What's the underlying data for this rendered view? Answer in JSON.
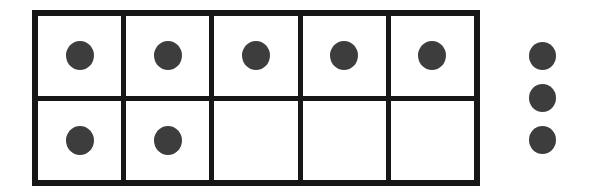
{
  "scene": {
    "title": "Ten frame with counters",
    "background_color": "#ffffff"
  },
  "ten_frame": {
    "name": "ten-frame",
    "columns": 5,
    "rows": 2,
    "total_cells": 10,
    "border_color": "#171717",
    "border_width_px": 6,
    "cell_background": "#ffffff",
    "grid": [
      [
        {
          "cell_index": 1,
          "filled": true,
          "counter_label": "counter"
        },
        {
          "cell_index": 2,
          "filled": true,
          "counter_label": "counter"
        },
        {
          "cell_index": 3,
          "filled": true,
          "counter_label": "counter"
        },
        {
          "cell_index": 4,
          "filled": true,
          "counter_label": "counter"
        },
        {
          "cell_index": 5,
          "filled": true,
          "counter_label": "counter"
        }
      ],
      [
        {
          "cell_index": 6,
          "filled": true,
          "counter_label": "counter"
        },
        {
          "cell_index": 7,
          "filled": true,
          "counter_label": "counter"
        },
        {
          "cell_index": 8,
          "filled": false,
          "counter_label": ""
        },
        {
          "cell_index": 9,
          "filled": false,
          "counter_label": ""
        },
        {
          "cell_index": 10,
          "filled": false,
          "counter_label": ""
        }
      ]
    ],
    "counters_in_frame": 7,
    "empty_cells": 3
  },
  "loose_counters": {
    "name": "loose-counters",
    "count": 3,
    "counter_color": "#3d3d3d",
    "items": [
      {
        "index": 1,
        "label": "counter"
      },
      {
        "index": 2,
        "label": "counter"
      },
      {
        "index": 3,
        "label": "counter"
      }
    ]
  },
  "totals": {
    "counters_total": 10
  }
}
